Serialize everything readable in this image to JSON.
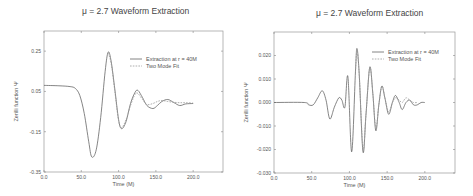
{
  "chart_data": [
    {
      "type": "line",
      "title": "μ = 2.7 Waveform Extraction",
      "xlabel": "Time (M)",
      "ylabel": "Zerilli function Ψ",
      "xlim": [
        0,
        240
      ],
      "ylim": [
        -0.35,
        0.35
      ],
      "xticks": [
        "0.0",
        "50.0",
        "100.0",
        "150.0",
        "200.0"
      ],
      "yticks": [
        "0.25",
        "0.05",
        "-0.15",
        "-0.35"
      ],
      "grid": false,
      "legend_position": "upper right",
      "series": [
        {
          "name": "Extraction at r = 40M",
          "style": "solid",
          "x": [
            0,
            20,
            35,
            42,
            48,
            54,
            60,
            64,
            70,
            76,
            82,
            86,
            90,
            95,
            100,
            104,
            110,
            116,
            122,
            126,
            132,
            138,
            146,
            152,
            158,
            166,
            174,
            182,
            190,
            200
          ],
          "y": [
            0.08,
            0.078,
            0.074,
            0.065,
            0.03,
            -0.06,
            -0.2,
            -0.275,
            -0.24,
            -0.08,
            0.15,
            0.245,
            0.2,
            0.06,
            -0.09,
            -0.135,
            -0.1,
            -0.01,
            0.045,
            0.055,
            0.02,
            -0.02,
            -0.035,
            -0.02,
            0.0,
            0.01,
            -0.005,
            -0.02,
            -0.012,
            -0.01
          ]
        },
        {
          "name": "Two Mode Fit",
          "style": "dashed",
          "x": [
            86,
            90,
            95,
            100,
            104,
            110,
            116,
            122,
            126,
            132,
            138,
            146,
            152,
            158,
            166,
            174,
            182,
            190,
            200
          ],
          "y": [
            0.24,
            0.19,
            0.05,
            -0.095,
            -0.13,
            -0.09,
            -0.02,
            0.035,
            0.04,
            0.01,
            -0.015,
            -0.01,
            0.0,
            0.005,
            0.0,
            -0.004,
            -0.006,
            -0.006,
            -0.008
          ]
        }
      ]
    },
    {
      "type": "line",
      "title": "μ = 2.7 Waveform Extraction",
      "xlabel": "Time (M)",
      "ylabel": "Zerilli function Ψ",
      "xlim": [
        0,
        240
      ],
      "ylim": [
        -0.03,
        0.03
      ],
      "xticks": [
        "0.0",
        "50.0",
        "100.0",
        "150.0",
        "200.0"
      ],
      "yticks": [
        "0.020",
        "0.010",
        "0.000",
        "-0.010",
        "-0.020",
        "-0.030"
      ],
      "grid": false,
      "legend_position": "upper right",
      "series": [
        {
          "name": "Extraction at r = 40M",
          "style": "solid",
          "x": [
            0,
            40,
            46,
            52,
            58,
            64,
            69,
            74,
            80,
            86,
            90,
            94,
            98,
            103,
            108,
            110,
            113,
            118,
            122,
            127,
            131,
            135,
            139,
            143,
            147,
            152,
            157,
            161,
            166,
            170,
            175,
            180,
            185,
            190,
            195,
            200
          ],
          "y": [
            0.0,
            0.0,
            -0.001,
            -0.001,
            0.002,
            0.005,
            0.001,
            -0.007,
            -0.002,
            0.002,
            0.001,
            -0.002,
            0.011,
            -0.021,
            0.013,
            0.023,
            0.012,
            -0.021,
            -0.005,
            0.015,
            0.004,
            -0.012,
            -0.001,
            0.007,
            0.002,
            -0.005,
            0.0,
            0.003,
            0.0,
            -0.003,
            0.0,
            0.001,
            -0.001,
            -0.001,
            0.0,
            0.0
          ]
        },
        {
          "name": "Two Mode Fit",
          "style": "dashed",
          "x": [
            108,
            110,
            113,
            118,
            122,
            127,
            131,
            135,
            139,
            143,
            147,
            152,
            157,
            161,
            166,
            170,
            175,
            180,
            185,
            190
          ],
          "y": [
            0.013,
            0.022,
            0.012,
            -0.02,
            -0.005,
            0.015,
            0.004,
            -0.011,
            -0.001,
            0.007,
            0.002,
            -0.004,
            0.0,
            0.002,
            0.001,
            0.0,
            0.002,
            0.001,
            0.0,
            0.0
          ]
        }
      ]
    }
  ],
  "charts": [
    {
      "title": "μ = 2.7 Waveform Extraction",
      "xlabel": "Time (M)",
      "ylabel": "Zerilli function Ψ",
      "legend": [
        "Extraction at r = 40M",
        "Two Mode Fit"
      ]
    },
    {
      "title": "μ = 2.7 Waveform Extraction",
      "xlabel": "Time (M)",
      "ylabel": "Zerilli function Ψ",
      "legend": [
        "Extraction at r = 40M",
        "Two Mode Fit"
      ]
    }
  ]
}
